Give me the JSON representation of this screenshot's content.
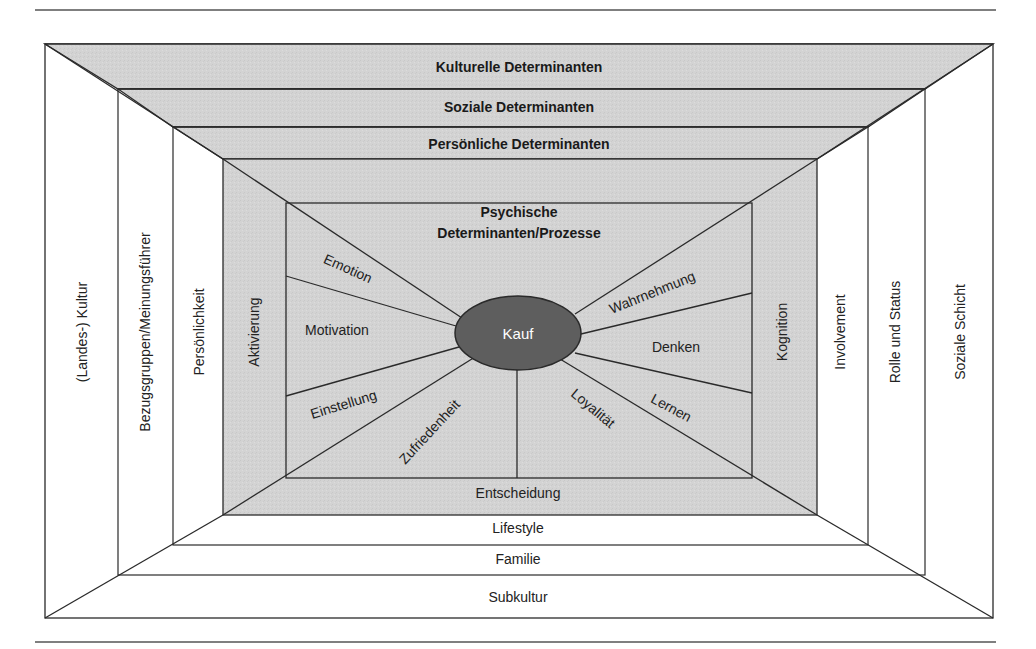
{
  "colors": {
    "background": "#ffffff",
    "shaded_band": "#d4d4d4",
    "line": "#2a2a2a",
    "rule": "#555555",
    "ellipse_fill": "#5e5e5e",
    "ellipse_text": "#ffffff",
    "text": "#222222"
  },
  "top_bands": {
    "kulturelle": "Kulturelle Determinanten",
    "soziale": "Soziale Determinanten",
    "persoenliche": "Persönliche Determinanten"
  },
  "left_columns": {
    "outer": "(Landes-) Kultur",
    "middle": "Bezugsgruppen/Meinungsführer",
    "inner": "Persönlichkeit",
    "innermost": "Aktivierung"
  },
  "right_columns": {
    "innermost": "Kognition",
    "inner": "Involvement",
    "middle": "Rolle und Status",
    "outer": "Soziale Schicht"
  },
  "bottom_bands": {
    "innermost": "Entscheidung",
    "inner": "Lifestyle",
    "middle": "Familie",
    "outer": "Subkultur"
  },
  "center": {
    "title_line1": "Psychische",
    "title_line2": "Determinanten/Prozesse",
    "core": "Kauf"
  },
  "segments": {
    "emotion": "Emotion",
    "motivation": "Motivation",
    "einstellung": "Einstellung",
    "zufriedenheit": "Zufriedenheit",
    "loyalitaet": "Loyalität",
    "lernen": "Lernen",
    "denken": "Denken",
    "wahrnehmung": "Wahrnehmung"
  }
}
